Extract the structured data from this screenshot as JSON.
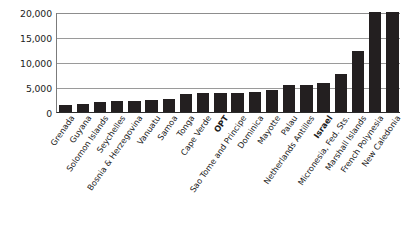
{
  "chart_data": {
    "type": "bar",
    "title": "",
    "subtitle": "",
    "xlabel": "",
    "ylabel": "",
    "ylim": [
      0,
      20000
    ],
    "yticks": [
      0,
      5000,
      10000,
      15000,
      20000
    ],
    "ytick_labels": [
      "0",
      "5,000",
      "10,000",
      "15,000",
      "20,000"
    ],
    "grid": true,
    "legend": "none",
    "bar_color": "#231f20",
    "gridline_color": "#9a9a9a",
    "axis_color": "#2b2b2b",
    "highlighted_categories": [
      "OPT",
      "Israel"
    ],
    "categories": [
      "Grenada",
      "Guyana",
      "Solomon Islands",
      "Seychelles",
      "Bosnia & Herzegovina",
      "Vanuatu",
      "Samoa",
      "Tonga",
      "Cape Verde",
      "OPT",
      "Sao Tome and Principe",
      "Dominica",
      "Mayotte",
      "Palau",
      "Netherlands Antilles",
      "Israel",
      "Micronesia, Fed. Sts.",
      "Marshall Islands",
      "French Polynesia",
      "New Caledonia"
    ],
    "values": [
      1500,
      1700,
      2100,
      2200,
      2300,
      2400,
      2600,
      3700,
      3800,
      3800,
      3900,
      4000,
      4400,
      5400,
      5500,
      5800,
      7600,
      12300,
      20000,
      20000
    ]
  }
}
